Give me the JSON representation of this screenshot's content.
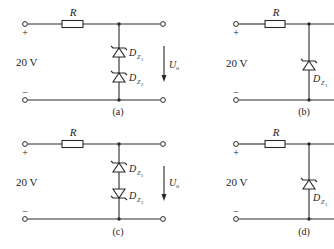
{
  "figure": {
    "panels": [
      {
        "id": "a",
        "caption": "(a)",
        "resistor_label": "R",
        "source_label": "20 V",
        "plus_sign": "+",
        "minus_sign": "−",
        "output_label": "U",
        "output_sub": "o",
        "diodes": [
          {
            "label": "D",
            "sub": "Z",
            "subsub": "1",
            "orientation": "cathode-up"
          },
          {
            "label": "D",
            "sub": "Z",
            "subsub": "2",
            "orientation": "cathode-up"
          }
        ]
      },
      {
        "id": "b",
        "caption": "(b)",
        "resistor_label": "R",
        "source_label": "20 V",
        "plus_sign": "+",
        "minus_sign": "−",
        "diodes": [
          {
            "label": "D",
            "sub": "Z",
            "subsub": "1",
            "orientation": "cathode-up"
          }
        ]
      },
      {
        "id": "c",
        "caption": "(c)",
        "resistor_label": "R",
        "source_label": "20 V",
        "plus_sign": "+",
        "minus_sign": "−",
        "output_label": "U",
        "output_sub": "o",
        "diodes": [
          {
            "label": "D",
            "sub": "Z",
            "subsub": "1",
            "orientation": "cathode-up"
          },
          {
            "label": "D",
            "sub": "Z",
            "subsub": "2",
            "orientation": "cathode-down"
          }
        ]
      },
      {
        "id": "d",
        "caption": "(d)",
        "resistor_label": "R",
        "source_label": "20 V",
        "plus_sign": "+",
        "minus_sign": "−",
        "diodes": [
          {
            "label": "D",
            "sub": "Z",
            "subsub": "1",
            "orientation": "cathode-up"
          }
        ]
      }
    ]
  }
}
